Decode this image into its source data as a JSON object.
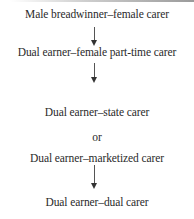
{
  "diagram": {
    "type": "flow",
    "nodes": [
      {
        "id": "n1",
        "label": "Male breadwinner–female carer"
      },
      {
        "id": "n2",
        "label": "Dual earner–female part-time carer"
      },
      {
        "id": "n3",
        "label": "Dual earner–state carer"
      },
      {
        "id": "sep",
        "label": "or"
      },
      {
        "id": "n4",
        "label": "Dual earner–marketized carer"
      },
      {
        "id": "n5",
        "label": "Dual earner–dual carer"
      }
    ],
    "edges": [
      {
        "from": "n1",
        "to": "n2"
      },
      {
        "from": "n2",
        "to": "n3 | n4"
      },
      {
        "from": "n4",
        "to": "n5"
      }
    ]
  }
}
